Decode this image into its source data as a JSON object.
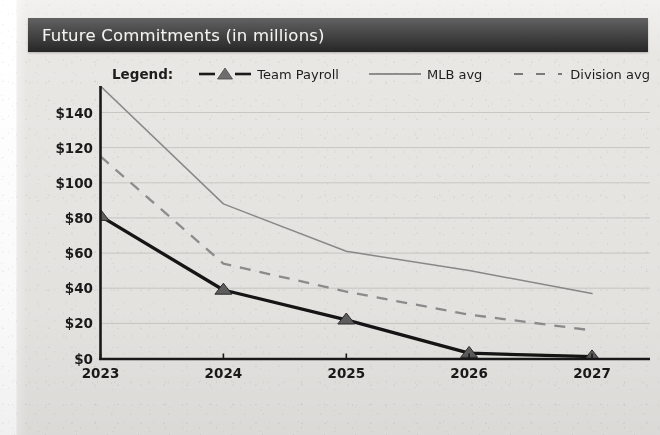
{
  "header": {
    "title": "Future Commitments (in millions)"
  },
  "legend": {
    "label": "Legend:",
    "entries": [
      {
        "name": "team-payroll",
        "label": "Team Payroll",
        "style": "solid-thick-marker",
        "color": "#1a1a1a"
      },
      {
        "name": "mlb-avg",
        "label": "MLB avg",
        "style": "solid-thin",
        "color": "#8a8a8a"
      },
      {
        "name": "division-avg",
        "label": "Division avg",
        "style": "dashed",
        "color": "#8a8a8a"
      }
    ]
  },
  "colors": {
    "paper": "#e8e7e4",
    "title_bar": "#262626",
    "axis": "#1a1a1a",
    "grid": "#c9c8c4",
    "team_payroll": "#1a1a1a",
    "mlb_avg": "#8a8a8a",
    "division_avg": "#8a8a8a"
  },
  "chart_data": {
    "type": "line",
    "title": "Future Commitments (in millions)",
    "xlabel": "",
    "ylabel": "",
    "x": [
      "2023",
      "2024",
      "2025",
      "2026",
      "2027"
    ],
    "categories": [
      "2023",
      "2024",
      "2025",
      "2026",
      "2027"
    ],
    "ylim": [
      0,
      160
    ],
    "ytick_values": [
      0,
      20,
      40,
      60,
      80,
      100,
      120,
      140
    ],
    "ytick_labels": [
      "$0",
      "$20",
      "$40",
      "$60",
      "$80",
      "$100",
      "$120",
      "$140"
    ],
    "xtick_labels": [
      "2023",
      "2024",
      "2025",
      "2026",
      "2027"
    ],
    "grid": true,
    "grid_axis": "y",
    "legend_position": "top",
    "series": [
      {
        "name": "Team Payroll",
        "values": [
          81,
          39,
          22,
          3,
          1
        ],
        "marker": "triangle",
        "linestyle": "solid",
        "linewidth": 3.2,
        "color": "#1a1a1a"
      },
      {
        "name": "MLB avg",
        "values": [
          155,
          88,
          61,
          50,
          37
        ],
        "marker": "none",
        "linestyle": "solid",
        "linewidth": 1.4,
        "color": "#8a8a8a"
      },
      {
        "name": "Division avg",
        "values": [
          115,
          54,
          38,
          25,
          16
        ],
        "marker": "none",
        "linestyle": "dashed",
        "linewidth": 2.2,
        "color": "#8a8a8a"
      }
    ]
  }
}
